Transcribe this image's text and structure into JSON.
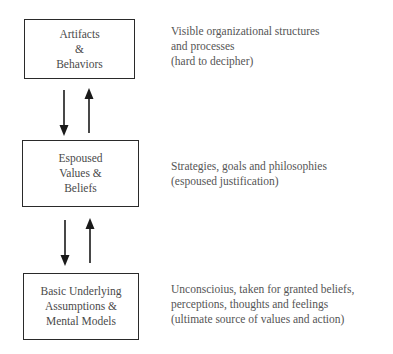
{
  "diagram": {
    "type": "layered-model",
    "levels": [
      {
        "box_lines": [
          "Artifacts",
          "&",
          "Behaviors"
        ],
        "description_lines": [
          "Visible organizational structures",
          "and processes",
          "(hard to decipher)"
        ]
      },
      {
        "box_lines": [
          "Espoused",
          "Values &",
          "Beliefs"
        ],
        "description_lines": [
          "Strategies, goals and philosophies",
          "(espoused justification)"
        ]
      },
      {
        "box_lines": [
          "Basic Underlying",
          "Assumptions &",
          "Mental Models"
        ],
        "description_lines": [
          "Unconscioius, taken for granted beliefs,",
          "perceptions, thoughts and feelings",
          "(ultimate source of values and action)"
        ]
      }
    ],
    "connectors": [
      {
        "between": [
          0,
          1
        ],
        "arrows": [
          "down-arrow",
          "up-arrow"
        ]
      },
      {
        "between": [
          1,
          2
        ],
        "arrows": [
          "down-arrow",
          "up-arrow"
        ]
      }
    ],
    "colors": {
      "box_border": "#2a2a2a",
      "arrow": "#1a1a1a",
      "text": "#4a4a4a",
      "background": "#ffffff"
    }
  }
}
